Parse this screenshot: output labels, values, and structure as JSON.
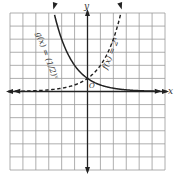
{
  "chart_data": {
    "type": "line",
    "title": "",
    "xlabel": "x",
    "ylabel": "y",
    "origin_label": "O",
    "xlim": [
      -6,
      6
    ],
    "ylim": [
      -6,
      6
    ],
    "grid": true,
    "series": [
      {
        "name": "g(x) = (1/2)^x",
        "style": "solid",
        "x": [
          -3,
          -2,
          -1,
          0,
          1,
          2,
          3,
          4,
          5,
          6
        ],
        "values": [
          8,
          4,
          2,
          1,
          0.5,
          0.25,
          0.125,
          0.0625,
          0.03125,
          0.015625
        ]
      },
      {
        "name": "f(x) = 2^x",
        "style": "dashed",
        "x": [
          -6,
          -5,
          -4,
          -3,
          -2,
          -1,
          0,
          1,
          2,
          3
        ],
        "values": [
          0.015625,
          0.03125,
          0.0625,
          0.125,
          0.25,
          0.5,
          1,
          2,
          4,
          8
        ]
      }
    ],
    "annotations": [
      {
        "text": "g(x) = (1/2)^x",
        "target": "solid curve"
      },
      {
        "text": "f(x) = 2^x",
        "target": "dashed curve"
      }
    ]
  },
  "labels": {
    "x_axis": "x",
    "y_axis": "y",
    "origin": "O",
    "g_prefix": "g(x) = ",
    "g_base": "(1/2)",
    "g_exp": "x",
    "f_label": "f(x) = 2",
    "f_exp": "x"
  }
}
